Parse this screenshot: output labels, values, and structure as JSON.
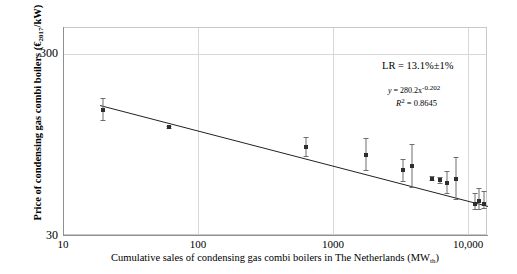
{
  "axes": {
    "y_title": "Price of condensing gas combi boilers (€2017/kW)",
    "y_title_main": "Price of condensing gas combi boilers (",
    "y_title_currency": "€",
    "y_title_sub": "2017",
    "y_title_tail": "/kW)",
    "x_title_main": "Cumulative sales of condensing gas combi boilers in The Netherlands (MW",
    "x_title_sub": "th",
    "x_title_tail": ")",
    "y_ticks": [
      "300",
      "30"
    ],
    "x_ticks": [
      "10",
      "100",
      "1000",
      "10,000"
    ]
  },
  "annotation": {
    "lr": "LR = 13.1%±1%",
    "eq_y": "y",
    "eq_body": " = 280.2x",
    "eq_exp": "-0.202",
    "r2_symbol": "R",
    "r2_sup": "2",
    "r2_value": " = 0.8645"
  },
  "chart_data": {
    "type": "scatter",
    "title": "",
    "xlabel": "Cumulative sales of condensing gas combi boilers in The Netherlands (MWth)",
    "ylabel": "Price of condensing gas combi boilers (€2017/kW)",
    "xscale": "log",
    "yscale": "log",
    "xlim": [
      10,
      10000
    ],
    "ylim": [
      30,
      300
    ],
    "xticks": [
      10,
      100,
      1000,
      10000
    ],
    "yticks": [
      30,
      300
    ],
    "grid": true,
    "legend": null,
    "fit": {
      "label": "y = 280.2x^-0.202",
      "a": 280.2,
      "b": -0.202,
      "r2": 0.8645,
      "learning_rate_pct": 13.1,
      "learning_rate_uncertainty_pct": 1.0
    },
    "points": [
      {
        "x": 19,
        "y": 148,
        "y_low": 130,
        "y_high": 172
      },
      {
        "x": 55,
        "y": 119,
        "y_low": 117,
        "y_high": 121
      },
      {
        "x": 513,
        "y": 93,
        "y_low": 83,
        "y_high": 105
      },
      {
        "x": 1380,
        "y": 84,
        "y_low": 69,
        "y_high": 104
      },
      {
        "x": 2500,
        "y": 69,
        "y_low": 60,
        "y_high": 79
      },
      {
        "x": 2900,
        "y": 73,
        "y_low": 56,
        "y_high": 96
      },
      {
        "x": 4000,
        "y": 62,
        "y_low": 61,
        "y_high": 64
      },
      {
        "x": 4600,
        "y": 61,
        "y_low": 59,
        "y_high": 63
      },
      {
        "x": 5100,
        "y": 59,
        "y_low": 52,
        "y_high": 68
      },
      {
        "x": 5900,
        "y": 62,
        "y_low": 48,
        "y_high": 81
      },
      {
        "x": 8100,
        "y": 45,
        "y_low": 42,
        "y_high": 52
      },
      {
        "x": 8700,
        "y": 47,
        "y_low": 42,
        "y_high": 55
      },
      {
        "x": 9400,
        "y": 45,
        "y_low": 43,
        "y_high": 53
      }
    ]
  }
}
